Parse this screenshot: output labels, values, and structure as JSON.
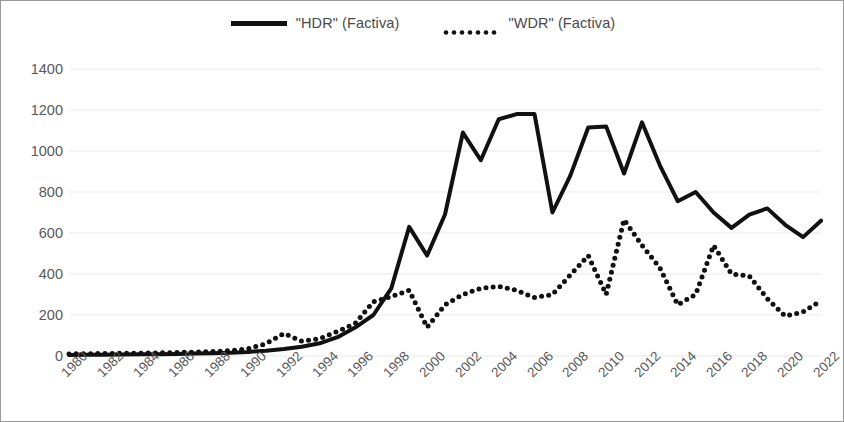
{
  "chart_data": {
    "type": "line",
    "title": "",
    "subtitle": "",
    "xlabel": "",
    "ylabel": "",
    "xlim": [
      1980,
      2022
    ],
    "ylim": [
      0,
      1400
    ],
    "ytick_step": 200,
    "xtick_step": 2,
    "grid": true,
    "legend_position": "top-center",
    "yticks": [
      "1400",
      "1200",
      "1000",
      "800",
      "600",
      "400",
      "200",
      "0"
    ],
    "ytick_values": [
      1400,
      1200,
      1000,
      800,
      600,
      400,
      200,
      0
    ],
    "xticks": [
      "1980",
      "1982",
      "1984",
      "1986",
      "1988",
      "1990",
      "1992",
      "1994",
      "1996",
      "1998",
      "2000",
      "2002",
      "2004",
      "2006",
      "2008",
      "2010",
      "2012",
      "2014",
      "2016",
      "2018",
      "2020",
      "2022"
    ],
    "x": [
      1980,
      1981,
      1982,
      1983,
      1984,
      1985,
      1986,
      1987,
      1988,
      1989,
      1990,
      1991,
      1992,
      1993,
      1994,
      1995,
      1996,
      1997,
      1998,
      1999,
      2000,
      2001,
      2002,
      2003,
      2004,
      2005,
      2006,
      2007,
      2008,
      2009,
      2010,
      2011,
      2012,
      2013,
      2014,
      2015,
      2016,
      2017,
      2018,
      2019,
      2020,
      2021,
      2022
    ],
    "series": [
      {
        "name": "\"HDR\" (Factiva)",
        "style": "solid",
        "color": "#111111",
        "width": 4,
        "values": [
          5,
          6,
          6,
          7,
          8,
          9,
          10,
          12,
          14,
          16,
          20,
          26,
          34,
          45,
          62,
          92,
          140,
          200,
          330,
          630,
          490,
          690,
          1090,
          955,
          1155,
          1180,
          1180,
          700,
          880,
          1115,
          1120,
          890,
          1140,
          930,
          755,
          800,
          700,
          625,
          690,
          720,
          640,
          580,
          660
        ]
      },
      {
        "name": "\"WDR\" (Factiva)",
        "style": "dotted",
        "color": "#111111",
        "width": 5,
        "values": [
          10,
          11,
          12,
          13,
          14,
          15,
          17,
          19,
          22,
          26,
          35,
          60,
          110,
          72,
          85,
          120,
          160,
          265,
          290,
          320,
          140,
          250,
          300,
          330,
          340,
          320,
          285,
          300,
          395,
          490,
          300,
          665,
          540,
          430,
          250,
          300,
          540,
          400,
          390,
          280,
          195,
          215,
          270
        ]
      }
    ]
  },
  "legend": {
    "entries": [
      {
        "label": "\"HDR\" (Factiva)",
        "icon": "solid-line-swatch"
      },
      {
        "label": "\"WDR\" (Factiva)",
        "icon": "dotted-line-swatch"
      }
    ]
  },
  "colors": {
    "line": "#111111",
    "grid": "#e8e8e8",
    "axis_text": "#595959",
    "legend_text": "#4a4a4a",
    "frame": "#9a9a9a"
  }
}
